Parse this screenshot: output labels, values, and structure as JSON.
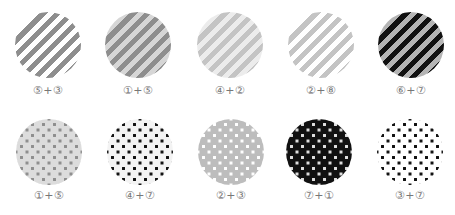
{
  "rows": [
    {
      "pattern": "diagonal-stripes",
      "swatches": [
        {
          "label": "⑤+③",
          "base": "#ffffff",
          "stripe": "#8e8e8e"
        },
        {
          "label": "①+⑤",
          "base": "#d6d6d6",
          "stripe": "#8e8e8e"
        },
        {
          "label": "④+②",
          "base": "#ececec",
          "stripe": "#c4c4c4"
        },
        {
          "label": "②+⑧",
          "base": "#ffffff",
          "stripe": "#c4c4c4"
        },
        {
          "label": "⑥+⑦",
          "base": "#b4b4b4",
          "stripe": "#111111"
        }
      ]
    },
    {
      "pattern": "dots",
      "swatches": [
        {
          "label": "①+⑤",
          "base": "#dcdcdc",
          "dot": "#8e8e8e"
        },
        {
          "label": "④+⑦",
          "base": "#f3f3f3",
          "dot": "#111111"
        },
        {
          "label": "②+③",
          "base": "#bdbdbd",
          "dot": "#ffffff"
        },
        {
          "label": "⑦+①",
          "base": "#111111",
          "dot": "#e0e0e0"
        },
        {
          "label": "③+⑦",
          "base": "#ffffff",
          "dot": "#111111"
        }
      ]
    }
  ]
}
